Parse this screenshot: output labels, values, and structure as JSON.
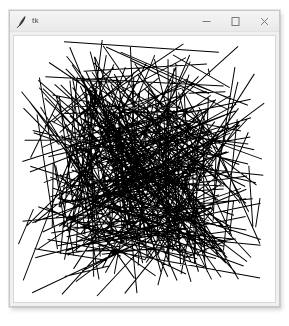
{
  "window": {
    "title": "tk",
    "app_icon": "feather-pen-icon",
    "frame_color": "#f0f0f0",
    "border_color": "#c8c8c8",
    "titlebar_color": "#eeeeee",
    "title_text_color": "#4a4a4a",
    "controls": [
      {
        "name": "minimize",
        "label": "—",
        "glyph": "minimize-icon"
      },
      {
        "name": "maximize",
        "label": "□",
        "glyph": "maximize-icon"
      },
      {
        "name": "close",
        "label": "×",
        "glyph": "close-icon"
      }
    ]
  },
  "canvas": {
    "background_color": "#ffffff",
    "line_color": "#000000",
    "line_width": 1,
    "border_color": "#d8d8d8",
    "width": 263,
    "height": 269,
    "segment_count": 420,
    "description": "random line segments"
  },
  "desktop": {
    "background_color": "#ffffff"
  }
}
